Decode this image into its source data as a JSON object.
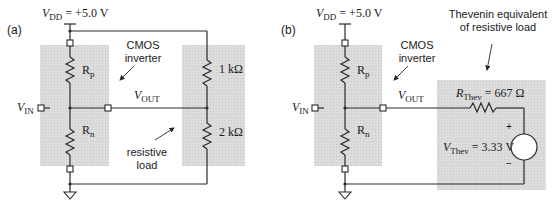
{
  "panels": {
    "a": {
      "label": "(a)",
      "vdd": {
        "symbol": "V",
        "sub": "DD",
        "value": " = +5.0 V"
      },
      "vin": {
        "symbol": "V",
        "sub": "IN"
      },
      "vout": {
        "symbol": "V",
        "sub": "OUT"
      },
      "rp": {
        "symbol": "R",
        "sub": "p"
      },
      "rn": {
        "symbol": "R",
        "sub": "n"
      },
      "cmos_label_line1": "CMOS",
      "cmos_label_line2": "inverter",
      "r_top": "1 kΩ",
      "r_bottom": "2 kΩ",
      "load_label_line1": "resistive",
      "load_label_line2": "load"
    },
    "b": {
      "label": "(b)",
      "vdd": {
        "symbol": "V",
        "sub": "DD",
        "value": " = +5.0 V"
      },
      "vin": {
        "symbol": "V",
        "sub": "IN"
      },
      "vout": {
        "symbol": "V",
        "sub": "OUT"
      },
      "rp": {
        "symbol": "R",
        "sub": "p"
      },
      "rn": {
        "symbol": "R",
        "sub": "n"
      },
      "cmos_label_line1": "CMOS",
      "cmos_label_line2": "inverter",
      "thev_title_line1": "Thevenin equivalent",
      "thev_title_line2": "of resistive load",
      "rthev": {
        "symbol": "R",
        "sub": "Thev",
        "value": " = 667 Ω"
      },
      "vthev": {
        "symbol": "V",
        "sub": "Thev",
        "value": " = 3.33 V"
      },
      "plus": "+",
      "minus": "−"
    }
  },
  "colors": {
    "shade": "#d9d9d9",
    "wire": "#2a2a2a"
  }
}
